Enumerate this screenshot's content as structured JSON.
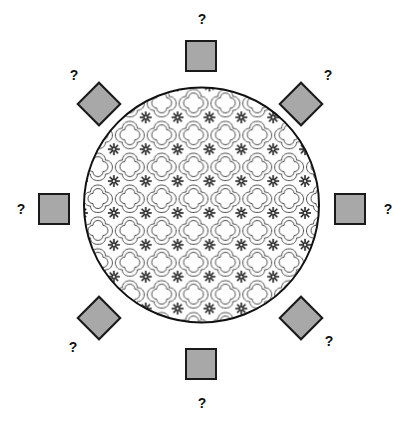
{
  "diagram": {
    "type": "seating-arrangement-puzzle",
    "table": {
      "shape": "circle",
      "pattern": "quatrefoil-floral-lattice",
      "fill_color": "#ffffff",
      "stroke_color": "#1a1a1a",
      "center_x": 201,
      "center_y": 205,
      "radius": 119
    },
    "seat_colors": {
      "fill": "#a8a8a8",
      "border": "#1a1a1a"
    },
    "label_text": "?",
    "seats": [
      {
        "id": "seat-north",
        "position": "north",
        "shape": "square",
        "label": "?",
        "x": 185,
        "y": 40,
        "label_x": 195,
        "label_y": 12
      },
      {
        "id": "seat-northeast",
        "position": "northeast",
        "shape": "diamond",
        "label": "?",
        "x": 285,
        "y": 88,
        "label_x": 321,
        "label_y": 68
      },
      {
        "id": "seat-east",
        "position": "east",
        "shape": "square",
        "label": "?",
        "x": 334,
        "y": 193,
        "label_x": 381,
        "label_y": 202
      },
      {
        "id": "seat-southeast",
        "position": "southeast",
        "shape": "diamond",
        "label": "?",
        "x": 285,
        "y": 302,
        "label_x": 322,
        "label_y": 334
      },
      {
        "id": "seat-south",
        "position": "south",
        "shape": "square",
        "label": "?",
        "x": 185,
        "y": 348,
        "label_x": 195,
        "label_y": 396
      },
      {
        "id": "seat-southwest",
        "position": "southwest",
        "shape": "diamond",
        "label": "?",
        "x": 83,
        "y": 302,
        "label_x": 66,
        "label_y": 340
      },
      {
        "id": "seat-west",
        "position": "west",
        "shape": "square",
        "label": "?",
        "x": 38,
        "y": 193,
        "label_x": 14,
        "label_y": 202
      },
      {
        "id": "seat-northwest",
        "position": "northwest",
        "shape": "diamond",
        "label": "?",
        "x": 83,
        "y": 88,
        "label_x": 67,
        "label_y": 68
      }
    ]
  }
}
